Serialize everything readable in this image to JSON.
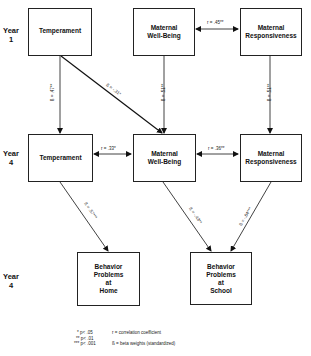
{
  "diagram": {
    "type": "path-model",
    "rows": [
      {
        "year_label_line1": "Year",
        "year_label_line2": "1"
      },
      {
        "year_label_line1": "Year",
        "year_label_line2": "4"
      },
      {
        "year_label_line1": "Year",
        "year_label_line2": "4"
      }
    ],
    "nodes": {
      "temp_y1": {
        "label": "Temperament"
      },
      "mwb_y1": {
        "line1": "Maternal",
        "line2": "Well-Being"
      },
      "mr_y1": {
        "line1": "Maternal",
        "line2": "Responsiveness"
      },
      "temp_y4": {
        "label": "Temperament"
      },
      "mwb_y4": {
        "line1": "Maternal",
        "line2": "Well-Being"
      },
      "mr_y4": {
        "line1": "Maternal",
        "line2": "Responsiveness"
      },
      "bp_home": {
        "line1": "Behavior",
        "line2": "Problems",
        "line3": "at",
        "line4": "Home"
      },
      "bp_school": {
        "line1": "Behavior",
        "line2": "Problems",
        "line3": "at",
        "line4": "School"
      }
    },
    "edges": {
      "mwb1_mr1": {
        "label": "r = .45**",
        "kind": "correlation"
      },
      "temp1_temp4": {
        "label": "ß = .47**",
        "kind": "beta"
      },
      "temp1_mwb4": {
        "label": "ß = -.31*",
        "kind": "beta"
      },
      "mwb1_mwb4": {
        "label": "ß = .51**",
        "kind": "beta"
      },
      "mr1_mr4": {
        "label": "ß = .51**",
        "kind": "beta"
      },
      "temp4_mwb4": {
        "label": "r = .33*",
        "kind": "correlation"
      },
      "mwb4_mr4": {
        "label": "r = .36**",
        "kind": "correlation"
      },
      "temp4_home": {
        "label": "ß = .57***",
        "kind": "beta"
      },
      "mwb4_school": {
        "label": "ß = -.43**",
        "kind": "beta"
      },
      "mr4_school": {
        "label": "ß = -.64***",
        "kind": "beta"
      }
    },
    "legend": {
      "p05": "* p< .05",
      "p01": "** p< .01",
      "p001": "*** p< .001",
      "r_def": "r = correlation coefficient",
      "b_def": "ß = beta weights (standardized)"
    }
  }
}
